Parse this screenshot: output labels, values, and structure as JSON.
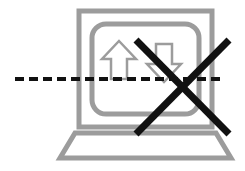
{
  "diagram": {
    "type": "prohibition-pictogram",
    "canvas": {
      "width": 245,
      "height": 171,
      "background": "#ffffff"
    },
    "colors": {
      "gray_stroke": "#9c9c9c",
      "gray_stroke_light": "#a8a8a8",
      "black_stroke": "#111111",
      "background": "#ffffff"
    },
    "elements": {
      "laptop_screen_outer": {
        "name": "laptop-screen-outer-frame",
        "shape": "rectangle",
        "x": 79,
        "y": 11,
        "width": 133,
        "height": 116,
        "stroke": "#9c9c9c",
        "stroke_width": 5,
        "fill": "none"
      },
      "laptop_screen_inner": {
        "name": "laptop-screen-inner-frame",
        "shape": "rounded-rectangle",
        "x": 92,
        "y": 24,
        "width": 107,
        "height": 90,
        "corner_radius": 14,
        "stroke": "#9c9c9c",
        "stroke_width": 5,
        "fill": "none"
      },
      "laptop_base": {
        "name": "laptop-base-trapezoid",
        "shape": "trapezoid",
        "points": "75,133 216,133 231,158 60,158",
        "stroke": "#9c9c9c",
        "stroke_width": 5,
        "fill": "none"
      },
      "arrow_up": {
        "name": "upload-arrow-up",
        "direction": "up",
        "points": "119,41 136,59 127,59 127,79 111,79 111,59 102,59",
        "stroke": "#9c9c9c",
        "stroke_width": 2.5,
        "fill": "none"
      },
      "arrow_down": {
        "name": "download-arrow-down",
        "direction": "down",
        "points": "156,44 172,44 172,64 181,64 164,82 147,64 156,64",
        "stroke": "#9c9c9c",
        "stroke_width": 2.5,
        "fill": "none"
      },
      "dashed_line": {
        "name": "dashed-horizontal-line",
        "x1": 15,
        "y1": 79,
        "x2": 222,
        "y2": 79,
        "stroke": "#111111",
        "stroke_width": 4,
        "dash_length": 9,
        "gap_length": 5
      },
      "cross_mark": {
        "name": "cross-out-x-mark",
        "stroke": "#111111",
        "stroke_width": 7,
        "stroke_1": {
          "x1": 136,
          "y1": 40,
          "x2": 229,
          "y2": 134
        },
        "stroke_2": {
          "x1": 229,
          "y1": 40,
          "x2": 136,
          "y2": 134
        }
      }
    }
  }
}
